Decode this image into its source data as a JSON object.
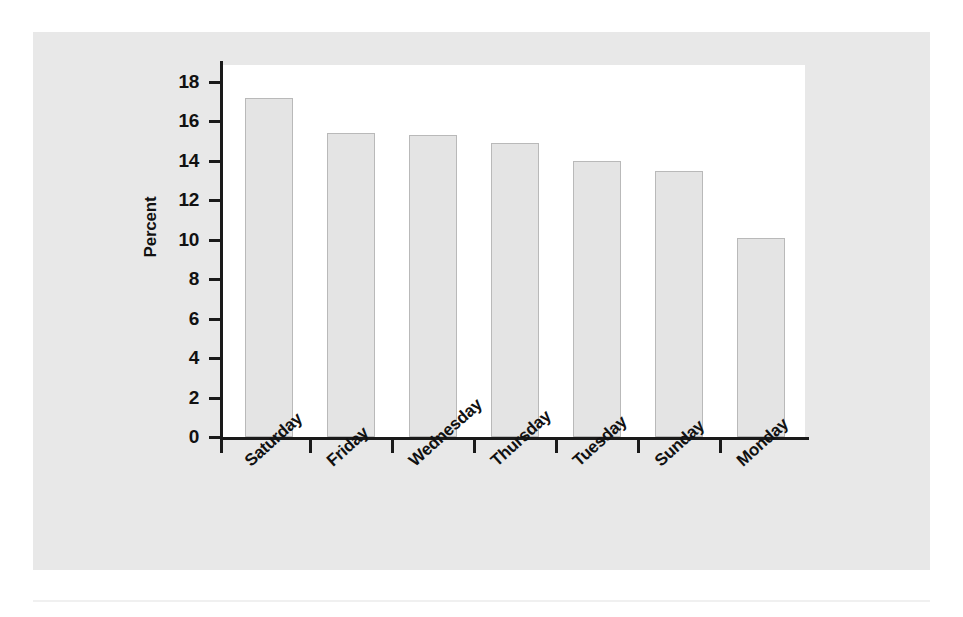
{
  "chart_data": {
    "type": "bar",
    "title": "",
    "xlabel": "",
    "ylabel": "Percent",
    "ylim": [
      0,
      18
    ],
    "ytick_step": 2,
    "yticks": [
      "18",
      "16",
      "14",
      "12",
      "10",
      "8",
      "6",
      "4",
      "2",
      "0"
    ],
    "grid": false,
    "legend": "none",
    "categories": [
      "Saturday",
      "Friday",
      "Wednesday",
      "Thursday",
      "Tuesday",
      "Sunday",
      "Monday"
    ],
    "values": [
      17.2,
      15.4,
      15.3,
      14.9,
      14.0,
      13.5,
      10.1
    ],
    "bar_fill_color": "#e4e4e4",
    "bar_border_color": "#b9b9b9",
    "axis_color": "#1a1a1a",
    "panel_background": "#e8e8e8",
    "plot_background": "#ffffff"
  },
  "figure": {
    "y_axis_title": "Percent"
  }
}
